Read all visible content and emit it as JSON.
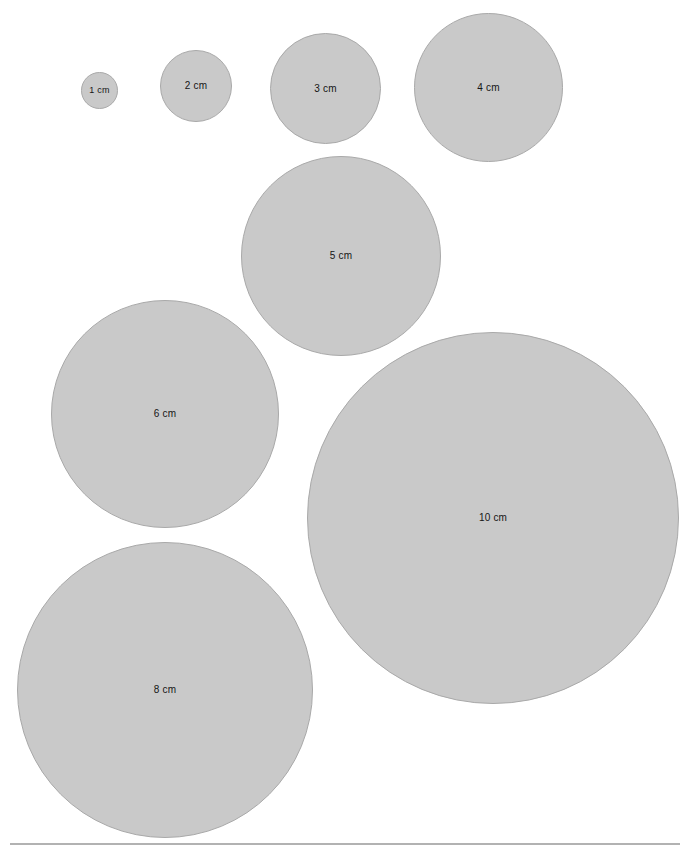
{
  "page": {
    "width": 686,
    "height": 857,
    "background_color": "#ffffff"
  },
  "style": {
    "circle_fill": "#c9c9c9",
    "circle_stroke": "#a9a9a9",
    "label_color": "#151515",
    "rule_color": "#b2b2b2"
  },
  "chart_data": {
    "type": "scatter",
    "xlabel": "",
    "ylabel": "",
    "unit": "cm",
    "legend": "none",
    "grid": false,
    "categories": [
      "1 cm",
      "2 cm",
      "3 cm",
      "4 cm",
      "5 cm",
      "6 cm",
      "8 cm",
      "10 cm"
    ],
    "values": [
      1,
      2,
      3,
      4,
      5,
      6,
      8,
      10
    ],
    "pixels_per_cm": 37,
    "circles": [
      {
        "label": "1 cm",
        "diameter_cm": 1,
        "diameter_px": 37,
        "left": 81,
        "top": 72,
        "center_x": 99.5,
        "center_y": 90.5,
        "font_size": 9
      },
      {
        "label": "2 cm",
        "diameter_cm": 2,
        "diameter_px": 72,
        "left": 160,
        "top": 50,
        "center_x": 196,
        "center_y": 86,
        "font_size": 10
      },
      {
        "label": "3 cm",
        "diameter_cm": 3,
        "diameter_px": 111,
        "left": 270,
        "top": 33,
        "center_x": 325.5,
        "center_y": 88.5,
        "font_size": 10
      },
      {
        "label": "4 cm",
        "diameter_cm": 4,
        "diameter_px": 149,
        "left": 414,
        "top": 13,
        "center_x": 488.5,
        "center_y": 87.5,
        "font_size": 10
      },
      {
        "label": "5 cm",
        "diameter_cm": 5,
        "diameter_px": 200,
        "left": 241,
        "top": 156,
        "center_x": 341,
        "center_y": 256,
        "font_size": 10
      },
      {
        "label": "6 cm",
        "diameter_cm": 6,
        "diameter_px": 228,
        "left": 51,
        "top": 300,
        "center_x": 165,
        "center_y": 414,
        "font_size": 10
      },
      {
        "label": "8 cm",
        "diameter_cm": 8,
        "diameter_px": 296,
        "left": 17,
        "top": 542,
        "center_x": 165,
        "center_y": 690,
        "font_size": 10
      },
      {
        "label": "10 cm",
        "diameter_cm": 10,
        "diameter_px": 372,
        "left": 307,
        "top": 332,
        "center_x": 493,
        "center_y": 518,
        "font_size": 10
      }
    ],
    "baseline_rule": {
      "left": 10,
      "top": 843,
      "width": 670
    },
    "annotations": []
  }
}
